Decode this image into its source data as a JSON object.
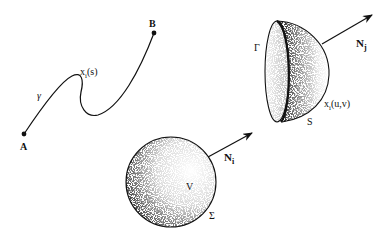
{
  "curve": {
    "start_label": "A",
    "end_label": "B",
    "name_label": "γ",
    "param_label_main": "x",
    "param_label_sub": "i",
    "param_label_args": "(s)"
  },
  "surface": {
    "boundary_label": "Γ",
    "surface_label": "S",
    "normal_label_main": "N",
    "normal_label_sub": "j",
    "param_label_main": "x",
    "param_label_sub": "i",
    "param_label_args": "(u,v)"
  },
  "volume": {
    "volume_label": "V",
    "boundary_label": "Σ",
    "normal_label_main": "N",
    "normal_label_sub": "i"
  },
  "colors": {
    "ink": "#111111",
    "background": "#ffffff"
  }
}
